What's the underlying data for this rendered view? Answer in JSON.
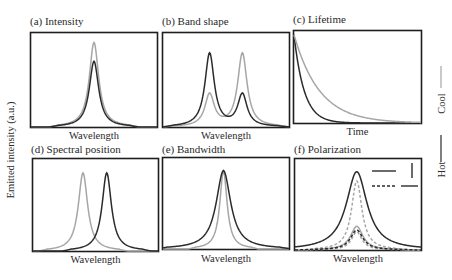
{
  "figure": {
    "ylabel": "Emitted intensity (a.u.)",
    "legend": {
      "cool_label": "Cool",
      "hot_label": "Hot",
      "cool_color": "#a6a6a6",
      "hot_color": "#2b2b2b"
    },
    "polarization_legend": {
      "solid_label": "parallel",
      "dashed_label": "perpendicular"
    }
  },
  "panels": [
    {
      "id": "a",
      "title": "(a) Intensity",
      "xlabel": "Wavelength"
    },
    {
      "id": "b",
      "title": "(b) Band shape",
      "xlabel": "Wavelength"
    },
    {
      "id": "c",
      "title": "(c) Lifetime",
      "xlabel": "Time"
    },
    {
      "id": "d",
      "title": "(d) Spectral position",
      "xlabel": "Wavelength"
    },
    {
      "id": "e",
      "title": "(e) Bandwidth",
      "xlabel": "Wavelength"
    },
    {
      "id": "f",
      "title": "(f) Polarization",
      "xlabel": "Wavelength"
    }
  ],
  "chart_data": [
    {
      "type": "line",
      "title": "(a) Intensity",
      "xlabel": "Wavelength",
      "ylabel": "Emitted intensity (a.u.)",
      "grid": false,
      "description": "Single Lorentzian-like peak at same wavelength; hot peak lower than cool peak",
      "series": [
        {
          "name": "Cool",
          "color": "#a6a6a6",
          "peak_center": 0.5,
          "peak_height": 0.9,
          "fwhm": 0.09
        },
        {
          "name": "Hot",
          "color": "#2b2b2b",
          "peak_center": 0.5,
          "peak_height": 0.7,
          "fwhm": 0.09
        }
      ]
    },
    {
      "type": "line",
      "title": "(b) Band shape",
      "xlabel": "Wavelength",
      "grid": false,
      "description": "Two peaks; relative heights swap between cool and hot",
      "series": [
        {
          "name": "Cool",
          "color": "#a6a6a6",
          "peaks": [
            {
              "center": 0.37,
              "height": 0.34
            },
            {
              "center": 0.63,
              "height": 0.78
            }
          ]
        },
        {
          "name": "Hot",
          "color": "#2b2b2b",
          "peaks": [
            {
              "center": 0.37,
              "height": 0.78
            },
            {
              "center": 0.63,
              "height": 0.34
            }
          ]
        }
      ]
    },
    {
      "type": "line",
      "title": "(c) Lifetime",
      "xlabel": "Time",
      "grid": false,
      "description": "Exponential decay; hot decays faster than cool",
      "series": [
        {
          "name": "Cool",
          "color": "#a6a6a6",
          "start": 0.96,
          "decay_constant": 0.2
        },
        {
          "name": "Hot",
          "color": "#2b2b2b",
          "start": 0.96,
          "decay_constant": 0.08
        }
      ]
    },
    {
      "type": "line",
      "title": "(d) Spectral position",
      "xlabel": "Wavelength",
      "grid": false,
      "description": "Peak shifts to longer wavelength when hot",
      "series": [
        {
          "name": "Cool",
          "color": "#a6a6a6",
          "peak_center": 0.4,
          "peak_height": 0.85,
          "fwhm": 0.09
        },
        {
          "name": "Hot",
          "color": "#2b2b2b",
          "peak_center": 0.59,
          "peak_height": 0.85,
          "fwhm": 0.09
        }
      ]
    },
    {
      "type": "line",
      "title": "(e) Bandwidth",
      "xlabel": "Wavelength",
      "grid": false,
      "description": "Same center and height; hot peak broader",
      "series": [
        {
          "name": "Cool",
          "color": "#a6a6a6",
          "peak_center": 0.48,
          "peak_height": 0.86,
          "fwhm": 0.07
        },
        {
          "name": "Hot",
          "color": "#2b2b2b",
          "peak_center": 0.48,
          "peak_height": 0.86,
          "fwhm": 0.14
        }
      ]
    },
    {
      "type": "line",
      "title": "(f) Polarization",
      "xlabel": "Wavelength",
      "grid": false,
      "description": "Solid = parallel polarization, dashed = perpendicular polarization; cool (gray) and hot (black) variants",
      "legend": [
        {
          "style": "solid",
          "orientation": "vertical arrow"
        },
        {
          "style": "dashed",
          "orientation": "horizontal arrow"
        }
      ],
      "series": [
        {
          "name": "Hot, solid",
          "color": "#2b2b2b",
          "dash": false,
          "peak_center": 0.49,
          "peak_height": 0.86,
          "fwhm": 0.2
        },
        {
          "name": "Cool, dashed",
          "color": "#a6a6a6",
          "dash": true,
          "peak_center": 0.49,
          "peak_height": 0.76,
          "fwhm": 0.1
        },
        {
          "name": "Cool, solid",
          "color": "#a6a6a6",
          "dash": false,
          "peak_center": 0.49,
          "peak_height": 0.26,
          "fwhm": 0.12
        },
        {
          "name": "Cool, dashed (low)",
          "color": "#a6a6a6",
          "dash": true,
          "peak_center": 0.49,
          "peak_height": 0.2,
          "fwhm": 0.1
        },
        {
          "name": "Hot, dashed",
          "color": "#2b2b2b",
          "dash": true,
          "peak_center": 0.49,
          "peak_height": 0.22,
          "fwhm": 0.12
        }
      ]
    }
  ]
}
